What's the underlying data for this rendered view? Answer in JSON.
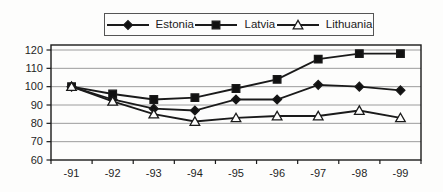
{
  "figure": {
    "background": "#fdfdfc",
    "line_color": "#1a1a1a",
    "gridline_color": "#9c9c9c",
    "marker_fill": "#111111",
    "open_marker_fill": "#fdfdfc"
  },
  "legend": {
    "items": [
      {
        "label": "Estonia",
        "marker": "diamond"
      },
      {
        "label": "Latvia",
        "marker": "square"
      },
      {
        "label": "Lithuania",
        "marker": "triangle"
      }
    ]
  },
  "chart_data": {
    "type": "line",
    "title": "",
    "xlabel": "",
    "ylabel": "",
    "categories": [
      "-91",
      "-92",
      "-93",
      "-94",
      "-95",
      "-96",
      "-97",
      "-98",
      "-99"
    ],
    "series": [
      {
        "name": "Estonia",
        "marker": "diamond",
        "filled": true,
        "values": [
          100,
          93,
          88,
          87,
          93,
          93,
          101,
          100,
          98
        ]
      },
      {
        "name": "Latvia",
        "marker": "square",
        "filled": true,
        "values": [
          100,
          96,
          93,
          94,
          99,
          104,
          115,
          118,
          118
        ]
      },
      {
        "name": "Lithuania",
        "marker": "triangle",
        "filled": false,
        "values": [
          100,
          92,
          85,
          81,
          83,
          84,
          84,
          87,
          83
        ]
      }
    ],
    "ylim": [
      60,
      120
    ],
    "y_ticks": [
      60,
      70,
      80,
      90,
      100,
      110,
      120
    ],
    "y_tick_labels": [
      "60",
      "70",
      "80",
      "90",
      "100",
      "110",
      "120"
    ],
    "grid": true,
    "legend_position": "top-center"
  }
}
